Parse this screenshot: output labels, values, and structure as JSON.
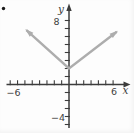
{
  "figure": {
    "bullet_glyph": "",
    "background": "#fdfdfd",
    "axis_color": "#3c3c3c",
    "label_color": "#3f3f3f",
    "curve_color": "#adadad",
    "labels": {
      "y_axis_var": "y",
      "x_axis_var": "x",
      "y_top_tick": "8",
      "y_bottom_tick": "−4",
      "x_left_tick": "−6",
      "x_right_tick": "6"
    }
  },
  "chart_data": {
    "type": "line",
    "title": "",
    "xlabel": "x",
    "ylabel": "y",
    "xlim": [
      -8.5,
      8.3
    ],
    "ylim": [
      -6.1,
      9.9
    ],
    "grid": false,
    "legend": false,
    "x_tick_step": 1,
    "y_tick_step": 1,
    "x_tick_range": [
      -8,
      6
    ],
    "y_tick_range": [
      -5,
      8
    ],
    "labeled_ticks": {
      "x": [
        -6,
        6
      ],
      "y": [
        8,
        -4
      ]
    },
    "series": [
      {
        "name": "v-shaped-graph",
        "description": "V-shaped absolute-value-style graph; vertex on y-axis at (0, 2); both rays end in arrowheads",
        "points": [
          [
            -5.8,
            6.8
          ],
          [
            0,
            2
          ],
          [
            6.5,
            6.6
          ]
        ],
        "arrow_ends": true,
        "color": "#adadad"
      }
    ],
    "pixel_origin": [
      69,
      84.5
    ],
    "pixel_per_unit": [
      7.35,
      8.0
    ]
  }
}
